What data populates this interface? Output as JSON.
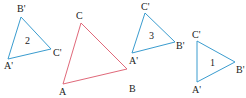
{
  "colors": {
    "original": "#e0697a",
    "image": "#3a9ccf"
  },
  "triangles": [
    {
      "id": "ABC",
      "number": "",
      "color": "#e0697a",
      "vertices": {
        "A": [
          63,
          84
        ],
        "B": [
          127,
          69
        ],
        "C": [
          81,
          23
        ]
      },
      "labels": {
        "A": "A",
        "B": "B",
        "C": "C"
      }
    },
    {
      "id": "tri-2",
      "number": "2",
      "color": "#3a9ccf",
      "vertices": {
        "A": [
          8,
          59
        ],
        "B": [
          21,
          17
        ],
        "C": [
          51,
          49
        ]
      },
      "labels": {
        "A": "A'",
        "B": "B'",
        "C": "C'"
      }
    },
    {
      "id": "tri-3",
      "number": "3",
      "color": "#3a9ccf",
      "vertices": {
        "A": [
          132,
          53
        ],
        "B": [
          175,
          42
        ],
        "C": [
          145,
          13
        ]
      },
      "labels": {
        "A": "A'",
        "B": "B'",
        "C": "C'"
      }
    },
    {
      "id": "tri-1",
      "number": "1",
      "color": "#3a9ccf",
      "vertices": {
        "A": [
          197,
          82
        ],
        "B": [
          235,
          62
        ],
        "C": [
          197,
          41
        ]
      },
      "labels": {
        "A": "A'",
        "B": "B'",
        "C": "C'"
      }
    }
  ]
}
